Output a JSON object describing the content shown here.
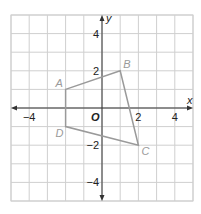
{
  "chart_data": {
    "type": "scatter",
    "title": "",
    "xlabel": "x",
    "ylabel": "y",
    "origin_label": "O",
    "xlim": [
      -5,
      5
    ],
    "ylim": [
      -5,
      5
    ],
    "grid": true,
    "x_ticks": [
      {
        "value": -4,
        "label": "−4"
      },
      {
        "value": 2,
        "label": "2"
      },
      {
        "value": 4,
        "label": "4"
      }
    ],
    "y_ticks": [
      {
        "value": 4,
        "label": "4"
      },
      {
        "value": 2,
        "label": "2"
      },
      {
        "value": -2,
        "label": "−2"
      },
      {
        "value": -4,
        "label": "−4"
      }
    ],
    "polygon": {
      "name": "ABCD",
      "color": "#9a9a9a",
      "vertices": [
        {
          "label": "A",
          "x": -2,
          "y": 1
        },
        {
          "label": "B",
          "x": 1,
          "y": 2
        },
        {
          "label": "C",
          "x": 2,
          "y": -2
        },
        {
          "label": "D",
          "x": -2,
          "y": -1
        }
      ]
    }
  },
  "colors": {
    "grid": "#cfcfcf",
    "axis": "#333333",
    "polygon": "#9a9a9a"
  }
}
